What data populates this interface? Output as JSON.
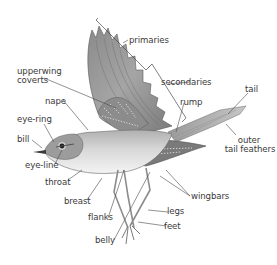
{
  "diagram": {
    "labels": {
      "primaries": "primaries",
      "secondaries": "secondaries",
      "upperwing_coverts_line1": "upperwing",
      "upperwing_coverts_line2": "coverts",
      "nape": "nape",
      "rump": "rump",
      "tail": "tail",
      "eye_ring": "eye-ring",
      "bill": "bill",
      "eye_line": "eye-line",
      "outer_tail_feathers_line1": "outer",
      "outer_tail_feathers_line2": "tail feathers",
      "throat": "throat",
      "breast": "breast",
      "wingbars": "wingbars",
      "flanks": "flanks",
      "legs": "legs",
      "feet": "feet",
      "belly": "belly"
    },
    "colors": {
      "line": "#4a4a4a",
      "text": "#3a3a3a",
      "feather_dark": "#6e6e6e",
      "feather_mid": "#9a9a9a",
      "feather_light": "#c8c8c8",
      "underparts": "#f2f2f2",
      "background": "#ffffff"
    }
  }
}
